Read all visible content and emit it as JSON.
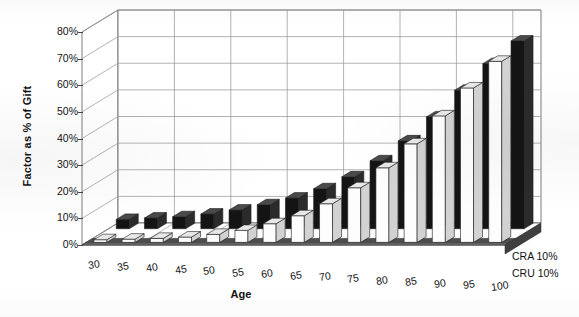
{
  "chart_data": {
    "type": "bar",
    "title": "",
    "subtitle": "",
    "xlabel": "Age",
    "ylabel": "Factor as % of Gift",
    "categories": [
      "30",
      "35",
      "40",
      "45",
      "50",
      "55",
      "60",
      "65",
      "70",
      "75",
      "80",
      "85",
      "90",
      "95",
      "100"
    ],
    "ytick_labels": [
      "0%",
      "10%",
      "20%",
      "30%",
      "40%",
      "50%",
      "60%",
      "70%",
      "80%"
    ],
    "ytick_values": [
      0,
      10,
      20,
      30,
      40,
      50,
      60,
      70,
      80
    ],
    "ylim": [
      0,
      80
    ],
    "grid": true,
    "legend_position": "depth-axis-right",
    "projection": "3d",
    "series": [
      {
        "name": "CRA 10%",
        "color": "#111111",
        "row": "back",
        "values": [
          3.5,
          4.0,
          4.5,
          5.5,
          7.0,
          9.0,
          11.5,
          15.0,
          19.5,
          25.5,
          33.0,
          42.0,
          52.0,
          62.0,
          70.5
        ]
      },
      {
        "name": "CRU 10%",
        "color": "#fdfdfd",
        "row": "front",
        "values": [
          1.0,
          1.2,
          1.5,
          2.0,
          3.0,
          4.5,
          7.0,
          10.0,
          14.5,
          20.5,
          28.0,
          37.0,
          47.5,
          58.0,
          68.0
        ]
      }
    ],
    "annotations": []
  },
  "axis_titles": {
    "y": "Factor as % of Gift",
    "x": "Age"
  }
}
